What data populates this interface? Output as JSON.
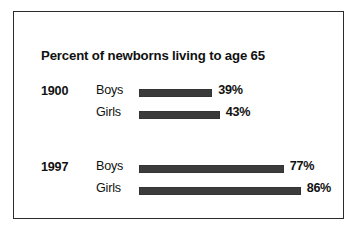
{
  "chart_data": {
    "type": "bar",
    "orientation": "horizontal",
    "title": "Percent of newborns living to age 65",
    "xlabel": "",
    "ylabel": "",
    "xlim": [
      0,
      100
    ],
    "grid": false,
    "legend": null,
    "value_suffix": "%",
    "groups": [
      {
        "label": "1900",
        "bars": [
          {
            "category": "Boys",
            "value": 39,
            "value_label": "39%"
          },
          {
            "category": "Girls",
            "value": 43,
            "value_label": "43%"
          }
        ]
      },
      {
        "label": "1997",
        "bars": [
          {
            "category": "Boys",
            "value": 77,
            "value_label": "77%"
          },
          {
            "category": "Girls",
            "value": 86,
            "value_label": "86%"
          }
        ]
      }
    ],
    "categories": [
      "1900 Boys",
      "1900 Girls",
      "1997 Boys",
      "1997 Girls"
    ],
    "values": [
      39,
      43,
      77,
      86
    ],
    "colors": {
      "bar": "#3b3b3b",
      "text": "#111111",
      "frame": "#2b2b2b",
      "background": "#ffffff"
    }
  },
  "figure": {
    "px_per_percent": 1.88,
    "bar_start_x": 125
  }
}
